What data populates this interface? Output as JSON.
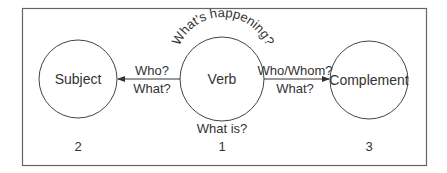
{
  "diagram": {
    "nodes": [
      {
        "id": "subject",
        "label": "Subject",
        "number": "2"
      },
      {
        "id": "verb",
        "label": "Verb",
        "number": "1"
      },
      {
        "id": "complement",
        "label": "Complement",
        "number": "3"
      }
    ],
    "verb_top_label": "What's happening?",
    "verb_bottom_label": "What is?",
    "edges": [
      {
        "from": "verb",
        "to": "subject",
        "line1": "Who?",
        "line2": "What?"
      },
      {
        "from": "verb",
        "to": "complement",
        "line1": "Who/Whom?",
        "line2": "What?"
      }
    ]
  }
}
